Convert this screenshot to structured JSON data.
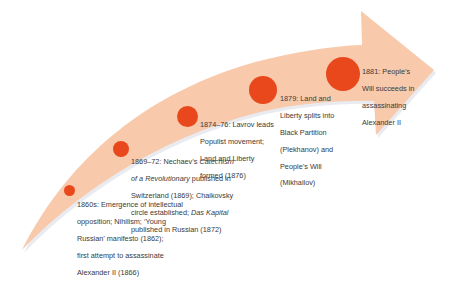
{
  "diagram": {
    "type": "timeline-arrow",
    "colors": {
      "arrow_fill": "#f8c9ab",
      "arrow_shadow": "#dfe3ea",
      "dot": "#e8481c",
      "text": "#3a3a3a"
    },
    "events": [
      {
        "date": "1860s:",
        "text_parts": [
          "Emergence of intellectual opposition; Nihilism; ‘Young Russian’ manifesto (1862); first attempt to assassinate Alexander II (1866)"
        ],
        "lines": [
          "1860s:  Emergence of intellectual",
          "opposition; Nihilism; ‘Young",
          "Russian’ manifesto (1862);",
          "first attempt to assassinate",
          "Alexander II (1866)"
        ]
      },
      {
        "date": "1869–72:",
        "lines": [
          "1869–72:  Nechaev’s ",
          "Catechism",
          "of a Revolutionary",
          " published in",
          "Switzerland (1869); Chaikovsky",
          "circle established; ",
          "Das Kapital",
          "published in Russian (1872)"
        ],
        "line1_prefix": "1869–72:  Nechaev’s ",
        "line1_italic": "Catechism",
        "line2_italic": "of a Revolutionary",
        "line2_rest": " published in",
        "line3": "Switzerland (1869); Chaikovsky",
        "line4_prefix": "circle established; ",
        "line4_italic": "Das Kapital",
        "line5": "published in Russian (1872)"
      },
      {
        "date": "1874–76:",
        "lines": [
          "1874–76:  Lavrov leads",
          "Populist movement;",
          "Land and Liberty",
          "formed (1876)"
        ]
      },
      {
        "date": "1879:",
        "lines": [
          "1879:  Land and",
          "Liberty splits into",
          "Black Partition",
          "(Plekhanov) and",
          "People’s Will",
          "(Mikhailov)"
        ]
      },
      {
        "date": "1881:",
        "lines": [
          "1881:  People’s",
          "Will succeeds in",
          "assassinating",
          "Alexander II"
        ]
      }
    ]
  }
}
